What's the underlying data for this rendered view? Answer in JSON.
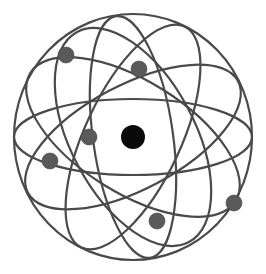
{
  "illustration": {
    "subject": "atom model",
    "colors": {
      "background": "#ffffff",
      "orbit": "#4a4a4a",
      "electron": "#5a5a5a",
      "nucleus": "#0a0a0a"
    },
    "center": [
      133,
      137
    ],
    "nucleus": {
      "cx": 133,
      "cy": 137,
      "r": 12
    },
    "orbits": [
      {
        "rx": 119,
        "ry": 123,
        "rotate": 0
      },
      {
        "rx": 119,
        "ry": 38,
        "rotate": 0
      },
      {
        "rx": 119,
        "ry": 52,
        "rotate": -28
      },
      {
        "rx": 119,
        "ry": 62,
        "rotate": 62
      },
      {
        "rx": 122,
        "ry": 48,
        "rotate": 115
      },
      {
        "rx": 121,
        "ry": 56,
        "rotate": 32
      },
      {
        "rx": 122,
        "ry": 40,
        "rotate": 82
      }
    ],
    "electrons": [
      {
        "cx": 66,
        "cy": 55,
        "r": 8
      },
      {
        "cx": 139,
        "cy": 69,
        "r": 8
      },
      {
        "cx": 89,
        "cy": 137,
        "r": 8
      },
      {
        "cx": 50,
        "cy": 161,
        "r": 8
      },
      {
        "cx": 157,
        "cy": 221,
        "r": 8
      },
      {
        "cx": 234,
        "cy": 203,
        "r": 8
      }
    ]
  }
}
